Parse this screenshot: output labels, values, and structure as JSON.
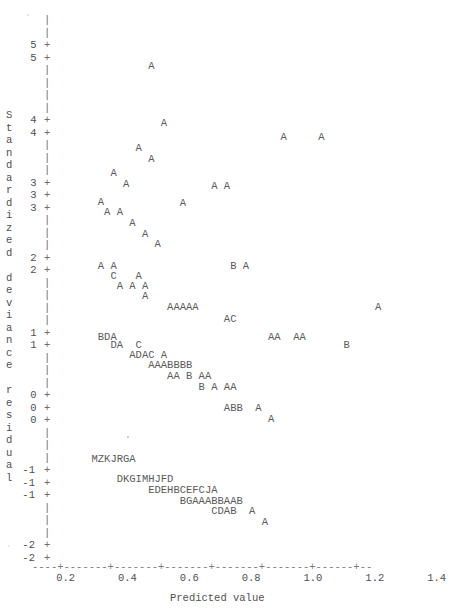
{
  "chart_data": {
    "type": "scatter",
    "title": "",
    "xlabel": "Predicted value",
    "ylabel": "Standardized deviance residual",
    "xlim": [
      0.13,
      1.46
    ],
    "ylim": [
      -2.25,
      5.45
    ],
    "xticks": [
      "0.2",
      "0.4",
      "0.6",
      "0.8",
      "1.0",
      "1.2",
      "1.4"
    ],
    "xtick_values": [
      0.2,
      0.4,
      0.6,
      0.8,
      1.0,
      1.2,
      1.4
    ],
    "yticks": [
      "5",
      "4",
      "3",
      "2",
      "1",
      "0",
      "-1",
      "-2"
    ],
    "ytick_values": [
      5,
      4,
      3,
      2,
      1,
      0,
      -1,
      -2
    ],
    "grid": false,
    "legend": null,
    "plot_style": "ascii-character-plot",
    "marker_note": "Letters encode overplotting counts: A=1 point, B=2, C=3, D=4, E=5, F=6, G=7, H=8, I=9, J=10, K=11, M=13, R=18, Z=26",
    "rows": [
      {
        "y": 4.8,
        "text": "              A"
      },
      {
        "y": 4.0,
        "text": "                A"
      },
      {
        "y": 3.8,
        "text": "                                   A     A"
      },
      {
        "y": 3.65,
        "text": "            A"
      },
      {
        "y": 3.5,
        "text": "              A"
      },
      {
        "y": 3.3,
        "text": "        A"
      },
      {
        "y": 3.15,
        "text": "          A"
      },
      {
        "y": 3.12,
        "text": "                        A A"
      },
      {
        "y": 2.9,
        "text": "      A"
      },
      {
        "y": 2.88,
        "text": "                   A"
      },
      {
        "y": 2.75,
        "text": "       A A"
      },
      {
        "y": 2.6,
        "text": "           A"
      },
      {
        "y": 2.45,
        "text": "             A"
      },
      {
        "y": 2.3,
        "text": "               A"
      },
      {
        "y": 2.0,
        "text": "      A A                  B A"
      },
      {
        "y": 1.85,
        "text": "        C   A"
      },
      {
        "y": 1.72,
        "text": "         A A A"
      },
      {
        "y": 1.58,
        "text": "             A"
      },
      {
        "y": 1.42,
        "text": "                 AAAAA                            A"
      },
      {
        "y": 1.25,
        "text": "                          AC"
      },
      {
        "y": 1.0,
        "text": "      BDA                        AA  AA"
      },
      {
        "y": 0.88,
        "text": "        DA  C                                B"
      },
      {
        "y": 0.75,
        "text": "           ADAC A"
      },
      {
        "y": 0.6,
        "text": "              AAABBBB"
      },
      {
        "y": 0.45,
        "text": "                 AA B AA"
      },
      {
        "y": 0.3,
        "text": "                      B A AA"
      },
      {
        "y": 0.0,
        "text": "                          ABB  A"
      },
      {
        "y": -0.15,
        "text": "                                 A"
      },
      {
        "y": -0.72,
        "text": "     MZKJRGA"
      },
      {
        "y": -1.0,
        "text": "         DKGIMHJFD"
      },
      {
        "y": -1.15,
        "text": "              EDEHBCEFCJA"
      },
      {
        "y": -1.3,
        "text": "                   BGAAABBAAB"
      },
      {
        "y": -1.45,
        "text": "                        CDAB  A"
      },
      {
        "y": -1.6,
        "text": "                                A"
      }
    ],
    "points_summary": {
      "n_rows": 34,
      "marker_letters_used": [
        "A",
        "B",
        "C",
        "D",
        "E",
        "F",
        "G",
        "H",
        "I",
        "J",
        "K",
        "M",
        "R",
        "Z"
      ]
    }
  },
  "axis": {
    "vertical_bar_glyph": "|",
    "tick_glyph": "+",
    "x_axis_dash_glyph": "-",
    "y_label_text": "Standardized deviance residual",
    "y_label_chars": [
      "S",
      "t",
      "a",
      "n",
      "d",
      "a",
      "r",
      "d",
      "i",
      "z",
      "e",
      "d",
      "",
      "d",
      "e",
      "v",
      "i",
      "a",
      "n",
      "c",
      "e",
      "",
      "r",
      "e",
      "s",
      "i",
      "d",
      "u",
      "a",
      "l"
    ],
    "x_label_text": "Predicted value"
  }
}
